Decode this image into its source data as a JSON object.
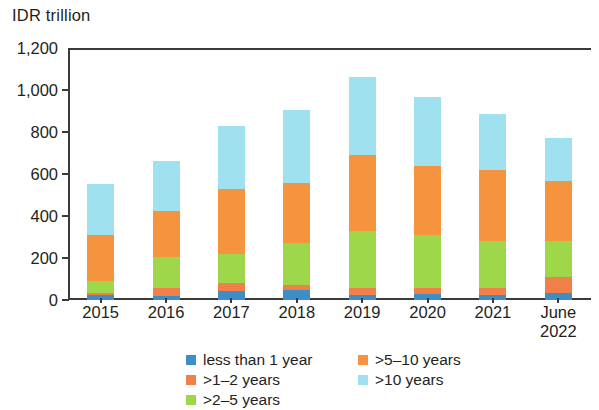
{
  "chart_data": {
    "type": "bar",
    "title": "",
    "subtitle": "",
    "xlabel": "",
    "ylabel": "IDR trillion",
    "ylim": [
      0,
      1200
    ],
    "yticks": [
      0,
      200,
      400,
      600,
      800,
      1000,
      1200
    ],
    "ytick_labels": [
      "0",
      "200",
      "400",
      "600",
      "800",
      "1,000",
      "1,200"
    ],
    "grid": false,
    "stacked": true,
    "legend_position": "bottom",
    "categories": [
      "2015",
      "2016",
      "2017",
      "2018",
      "2019",
      "2020",
      "2021",
      "June\n2022"
    ],
    "series": [
      {
        "name": "less than 1 year",
        "color": "#3d8ec4",
        "values": [
          22,
          18,
          45,
          48,
          22,
          30,
          22,
          35
        ]
      },
      {
        "name": ">1–2 years",
        "color": "#f07f4a",
        "values": [
          10,
          38,
          38,
          22,
          33,
          28,
          33,
          75
        ]
      },
      {
        "name": ">2–5 years",
        "color": "#9ed84a",
        "values": [
          58,
          148,
          135,
          200,
          275,
          252,
          225,
          170
        ]
      },
      {
        "name": ">5–10 years",
        "color": "#f5933f",
        "values": [
          220,
          218,
          310,
          285,
          360,
          330,
          340,
          285
        ]
      },
      {
        "name": ">10 years",
        "color": "#9fe1ef",
        "values": [
          245,
          240,
          300,
          350,
          370,
          325,
          265,
          205
        ]
      }
    ],
    "totals": [
      555,
      662,
      828,
      905,
      1060,
      965,
      885,
      770
    ]
  },
  "axis": {
    "unit_title": "IDR trillion"
  },
  "legend": {
    "left_column": [
      {
        "label": "less than 1 year",
        "color": "#3d8ec4"
      },
      {
        "label": ">1–2 years",
        "color": "#f07f4a"
      },
      {
        "label": ">2–5 years",
        "color": "#9ed84a"
      }
    ],
    "right_column": [
      {
        "label": ">5–10 years",
        "color": "#f5933f"
      },
      {
        "label": ">10 years",
        "color": "#9fe1ef"
      }
    ]
  },
  "colors": {
    "axis": "#3b3b3b",
    "text": "#231f20",
    "background": "#ffffff"
  }
}
